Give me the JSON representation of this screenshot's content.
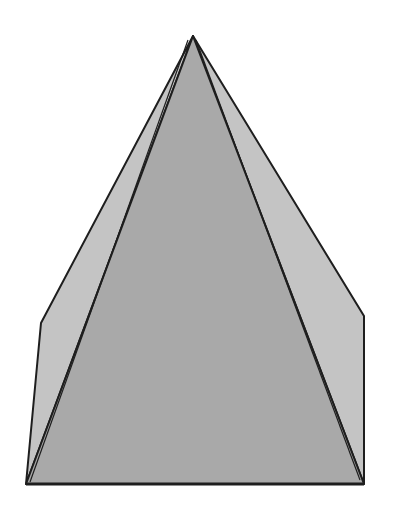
{
  "figure": {
    "colors": {
      "background": "#ffffff",
      "front_face": "#a9a9a9",
      "side_face": "#c4c4c4",
      "edge": "#1e1e1e"
    },
    "vertices": {
      "apex": [
        193,
        36
      ],
      "left_shoulder": [
        41,
        323
      ],
      "right_shoulder": [
        364,
        316
      ],
      "bottom_left": [
        26,
        484
      ],
      "bottom_right": [
        364,
        484
      ]
    }
  }
}
